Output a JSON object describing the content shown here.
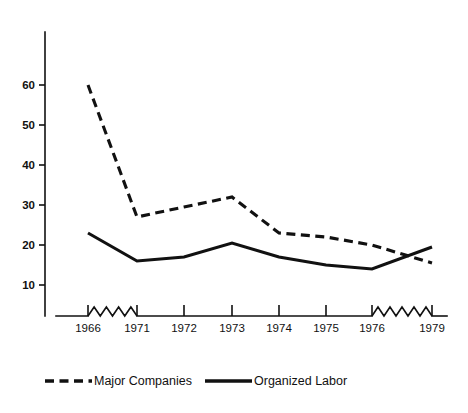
{
  "chart_data": {
    "type": "line",
    "title": "",
    "subtitle": "",
    "xlabel": "",
    "ylabel": "",
    "grid": false,
    "legend_position": "bottom",
    "x": [
      "1966",
      "1971",
      "1972",
      "1973",
      "1974",
      "1975",
      "1976",
      "1979"
    ],
    "categories": [
      "1966",
      "1971",
      "1972",
      "1973",
      "1974",
      "1975",
      "1976",
      "1979"
    ],
    "xtick_labels": [
      "1966",
      "1971",
      "1972",
      "1973",
      "1974",
      "1975",
      "1976",
      "1979"
    ],
    "ytick_labels": [
      "10",
      "20",
      "30",
      "40",
      "50",
      "60"
    ],
    "ytick_values": [
      10,
      20,
      30,
      40,
      50,
      60
    ],
    "ylim": [
      0,
      68
    ],
    "axis_breaks": [
      {
        "between": [
          "1966",
          "1971"
        ],
        "style": "zigzag"
      },
      {
        "between": [
          "1976",
          "1979"
        ],
        "style": "zigzag"
      }
    ],
    "series": [
      {
        "name": "Major Companies",
        "style": "dashed",
        "color": "#111111",
        "values": [
          60,
          27,
          29.5,
          32,
          23,
          22,
          20,
          15.5
        ]
      },
      {
        "name": "Organized Labor",
        "style": "solid",
        "color": "#111111",
        "values": [
          23,
          16,
          17,
          20.5,
          17,
          15,
          14,
          19.5
        ]
      }
    ]
  },
  "legend": {
    "items": [
      {
        "label": "Major Companies",
        "style": "dashed"
      },
      {
        "label": "Organized Labor",
        "style": "solid"
      }
    ]
  },
  "colors": {
    "ink": "#111111",
    "background": "#ffffff"
  }
}
